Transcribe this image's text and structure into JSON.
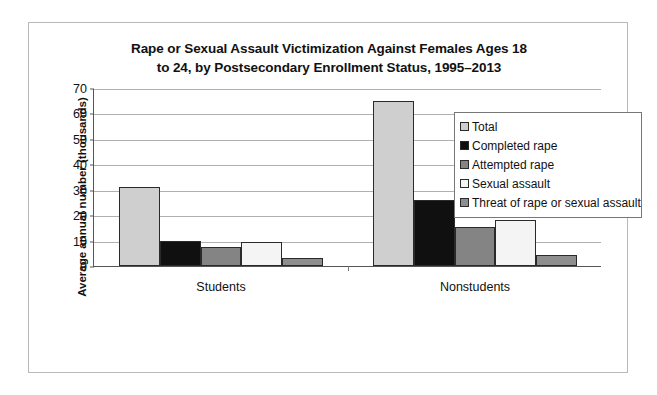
{
  "chart_data": {
    "type": "bar",
    "title": "Rape or Sexual Assault Victimization Against Females Ages 18 to 24, by Postsecondary Enrollment Status, 1995–2013",
    "title_line1": "Rape or Sexual Assault Victimization Against Females Ages 18",
    "title_line2": "to 24, by Postsecondary Enrollment Status, 1995–2013",
    "xlabel": "",
    "ylabel": "Average annual number (thousands)",
    "categories": [
      "Students",
      "Nonstudents"
    ],
    "ylim": [
      0,
      70
    ],
    "yticks": [
      0,
      10,
      20,
      30,
      40,
      50,
      60,
      70
    ],
    "ytick_labels": [
      "0",
      "10",
      "20",
      "30",
      "40",
      "50",
      "60",
      "70"
    ],
    "grid": true,
    "legend_position": "upper right",
    "series": [
      {
        "name": "Total",
        "values": [
          31,
          65
        ],
        "color": "#cfcfcf"
      },
      {
        "name": "Completed rape",
        "values": [
          10,
          26
        ],
        "color": "#101010"
      },
      {
        "name": "Attempted rape",
        "values": [
          7.5,
          15.5
        ],
        "color": "#848484"
      },
      {
        "name": "Sexual assault",
        "values": [
          9.5,
          18
        ],
        "color": "#f4f4f4"
      },
      {
        "name": "Threat of rape or sexual assault",
        "values": [
          3,
          4.5
        ],
        "color": "#8e8e8e"
      }
    ]
  },
  "legend": {
    "items": [
      {
        "label": "Total"
      },
      {
        "label": "Completed rape"
      },
      {
        "label": "Attempted rape"
      },
      {
        "label": "Sexual assault"
      },
      {
        "label": "Threat of rape or sexual assault"
      }
    ]
  }
}
